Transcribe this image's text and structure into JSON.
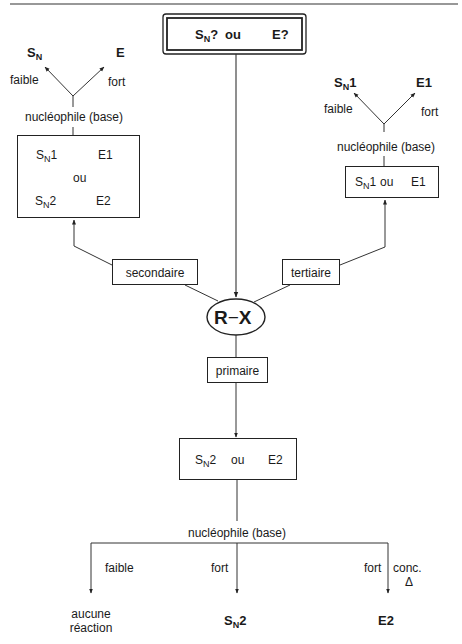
{
  "title_box": {
    "sn": "S",
    "sn_sub": "N",
    "sn_suffix": "?",
    "ou": "ou",
    "e": "E?"
  },
  "center": {
    "substrate": "R",
    "dash": "−",
    "leaving": "X"
  },
  "branches": {
    "secondaire": "secondaire",
    "tertiaire": "tertiaire",
    "primaire": "primaire"
  },
  "left_tree": {
    "top_left": {
      "main": "S",
      "sub": "N",
      "suffix": ""
    },
    "top_right": "E",
    "label_left": "faible",
    "label_right": "fort",
    "nucleophile": "nucléophile (base)",
    "box": {
      "r1_left": {
        "main": "S",
        "sub": "N",
        "suffix": "1"
      },
      "r1_right": "E1",
      "ou": "ou",
      "r2_left": {
        "main": "S",
        "sub": "N",
        "suffix": "2"
      },
      "r2_right": "E2"
    }
  },
  "right_tree": {
    "top_left": {
      "main": "S",
      "sub": "N",
      "suffix": "1"
    },
    "top_right": "E1",
    "label_left": "faible",
    "label_right": "fort",
    "nucleophile": "nucléophile (base)",
    "box": {
      "left": {
        "main": "S",
        "sub": "N",
        "suffix": "1"
      },
      "ou": "ou",
      "right": "E1"
    }
  },
  "bottom_tree": {
    "box": {
      "left": {
        "main": "S",
        "sub": "N",
        "suffix": "2"
      },
      "ou": "ou",
      "right": "E2"
    },
    "nucleophile": "nucléophile (base)",
    "branches": [
      {
        "label": "faible",
        "result_line1": "aucune",
        "result_line2": "réaction"
      },
      {
        "label": "fort",
        "result": {
          "main": "S",
          "sub": "N",
          "suffix": "2"
        }
      },
      {
        "label": "fort",
        "extra_line1": "conc.",
        "extra_line2": "Δ",
        "result": "E2"
      }
    ]
  }
}
